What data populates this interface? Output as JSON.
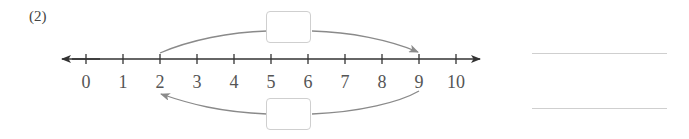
{
  "problem": {
    "label": "(2)"
  },
  "number_line": {
    "min": 0,
    "max": 10,
    "ticks": [
      "0",
      "1",
      "2",
      "3",
      "4",
      "5",
      "6",
      "7",
      "8",
      "9",
      "10"
    ],
    "axis_color": "#333333",
    "arc_color": "#8a8a8a"
  },
  "jumps": [
    {
      "from": 2,
      "to": 9,
      "position": "above",
      "box_value": ""
    },
    {
      "from": 9,
      "to": 2,
      "position": "below",
      "box_value": ""
    }
  ],
  "answer_lines": [
    {
      "value": ""
    },
    {
      "value": ""
    }
  ]
}
